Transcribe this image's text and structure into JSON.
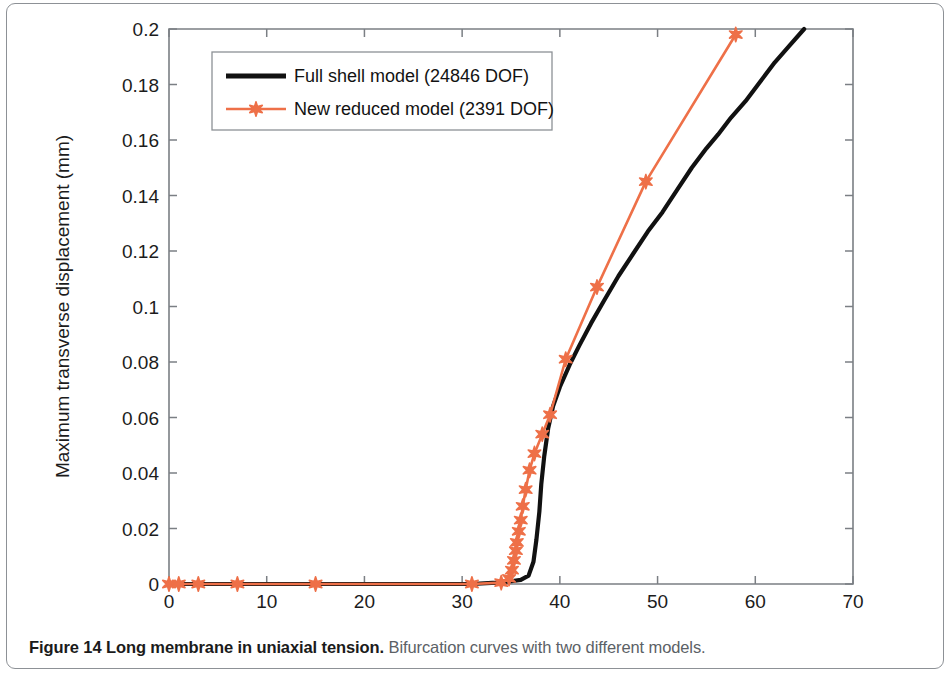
{
  "figure": {
    "caption_bold": "Figure 14 Long membrane in uniaxial tension.",
    "caption_rest": " Bifurcation curves with two different models."
  },
  "chart_data": {
    "type": "line",
    "title": "",
    "xlabel": "Tensile load Ny (N/mm)",
    "ylabel": "Maximum transverse displacement (mm)",
    "xlim": [
      0,
      70
    ],
    "ylim": [
      0,
      0.2
    ],
    "xticks": [
      0,
      10,
      20,
      30,
      40,
      50,
      60,
      70
    ],
    "xticklabels": [
      "0",
      "10",
      "20",
      "30",
      "40",
      "50",
      "60",
      "70"
    ],
    "yticks": [
      0,
      0.02,
      0.04,
      0.06,
      0.08,
      0.1,
      0.12,
      0.14,
      0.16,
      0.18,
      0.2
    ],
    "yticklabels": [
      "0",
      "0.02",
      "0.04",
      "0.06",
      "0.08",
      "0.1",
      "0.12",
      "0.14",
      "0.16",
      "0.18",
      "0.2"
    ],
    "grid": false,
    "legend_position": "upper left",
    "colors": {
      "full_shell": "#111111",
      "new_reduced": "#ee7048"
    },
    "series": [
      {
        "name": "Full shell model (24846 DOF)",
        "legend_label": "Full shell model (24846 DOF)",
        "color": "#111111",
        "marker": "none",
        "linewidth": 4.2,
        "points": [
          [
            0.0,
            0.0
          ],
          [
            2.0,
            0.0
          ],
          [
            5.0,
            0.0
          ],
          [
            9.0,
            0.0
          ],
          [
            14.0,
            0.0
          ],
          [
            19.0,
            0.0
          ],
          [
            24.0,
            0.0
          ],
          [
            28.0,
            0.0
          ],
          [
            31.0,
            0.0
          ],
          [
            33.5,
            0.0005
          ],
          [
            35.0,
            0.001
          ],
          [
            36.0,
            0.0015
          ],
          [
            36.8,
            0.003
          ],
          [
            37.3,
            0.008
          ],
          [
            37.6,
            0.016
          ],
          [
            37.9,
            0.026
          ],
          [
            38.1,
            0.036
          ],
          [
            38.4,
            0.046
          ],
          [
            38.8,
            0.056
          ],
          [
            39.3,
            0.064
          ],
          [
            40.0,
            0.071
          ],
          [
            41.0,
            0.079
          ],
          [
            42.0,
            0.086
          ],
          [
            43.2,
            0.094
          ],
          [
            44.5,
            0.102
          ],
          [
            46.0,
            0.111
          ],
          [
            47.5,
            0.119
          ],
          [
            49.0,
            0.127
          ],
          [
            50.5,
            0.134
          ],
          [
            52.0,
            0.142
          ],
          [
            53.5,
            0.15
          ],
          [
            55.0,
            0.157
          ],
          [
            56.2,
            0.162
          ],
          [
            57.5,
            0.168
          ],
          [
            59.0,
            0.174
          ],
          [
            60.5,
            0.181
          ],
          [
            62.0,
            0.188
          ],
          [
            63.5,
            0.194
          ],
          [
            65.0,
            0.2
          ]
        ]
      },
      {
        "name": "New reduced model (2391 DOF)",
        "legend_label": "New reduced model (2391 DOF)",
        "color": "#ee7048",
        "marker": "star6",
        "linewidth": 2.6,
        "points": [
          [
            0.0,
            0.0
          ],
          [
            1.0,
            0.0
          ],
          [
            3.0,
            0.0
          ],
          [
            7.0,
            0.0
          ],
          [
            15.0,
            0.0
          ],
          [
            31.0,
            0.0
          ],
          [
            34.0,
            0.0005
          ],
          [
            34.8,
            0.002
          ],
          [
            35.1,
            0.005
          ],
          [
            35.3,
            0.0085
          ],
          [
            35.5,
            0.012
          ],
          [
            35.6,
            0.015
          ],
          [
            35.8,
            0.019
          ],
          [
            36.0,
            0.023
          ],
          [
            36.2,
            0.028
          ],
          [
            36.5,
            0.034
          ],
          [
            36.9,
            0.041
          ],
          [
            37.4,
            0.047
          ],
          [
            38.2,
            0.054
          ],
          [
            39.0,
            0.061
          ],
          [
            40.6,
            0.081
          ],
          [
            43.8,
            0.107
          ],
          [
            48.8,
            0.145
          ],
          [
            58.0,
            0.198
          ]
        ],
        "markers": [
          [
            0.0,
            0.0
          ],
          [
            1.0,
            0.0
          ],
          [
            3.0,
            0.0
          ],
          [
            7.0,
            0.0
          ],
          [
            15.0,
            0.0
          ],
          [
            31.0,
            0.0
          ],
          [
            34.0,
            0.0005
          ],
          [
            34.8,
            0.002
          ],
          [
            35.1,
            0.005
          ],
          [
            35.3,
            0.0085
          ],
          [
            35.5,
            0.012
          ],
          [
            35.6,
            0.015
          ],
          [
            35.8,
            0.019
          ],
          [
            36.0,
            0.023
          ],
          [
            36.2,
            0.028
          ],
          [
            36.5,
            0.034
          ],
          [
            36.9,
            0.041
          ],
          [
            37.4,
            0.047
          ],
          [
            38.2,
            0.054
          ],
          [
            39.0,
            0.061
          ],
          [
            40.6,
            0.081
          ],
          [
            43.8,
            0.107
          ],
          [
            48.8,
            0.145
          ],
          [
            58.0,
            0.198
          ]
        ]
      }
    ]
  }
}
